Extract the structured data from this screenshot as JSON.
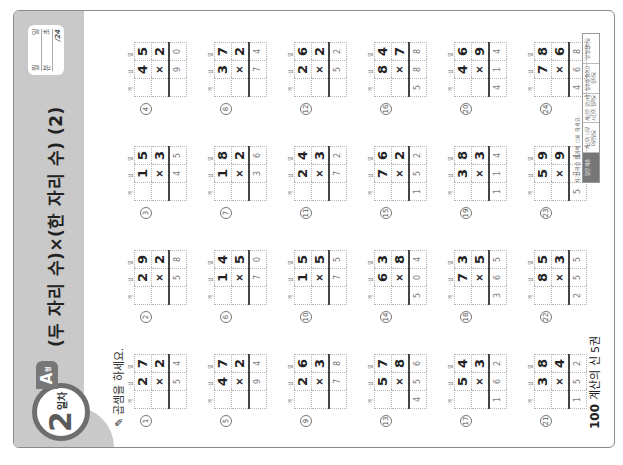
{
  "header": {
    "day_number": "2",
    "day_suffix": "일차",
    "type_label": "A",
    "type_suffix": "형",
    "title": "(두 자리 수)×(한 자리 수) (2)",
    "score_box": {
      "month_label": "월",
      "day_label": "일",
      "minute_label": "분",
      "second_label": "초",
      "total": "/24"
    }
  },
  "instruction": "곱셈을 하세요.",
  "column_headers": [
    "백",
    "십",
    "일"
  ],
  "operator": "×",
  "problems": [
    {
      "n": "1",
      "a": [
        "2",
        "7"
      ],
      "b": "2",
      "ans": [
        "",
        "5",
        "4"
      ]
    },
    {
      "n": "2",
      "a": [
        "2",
        "9"
      ],
      "b": "2",
      "ans": [
        "",
        "5",
        "8"
      ]
    },
    {
      "n": "3",
      "a": [
        "1",
        "5"
      ],
      "b": "3",
      "ans": [
        "",
        "4",
        "5"
      ]
    },
    {
      "n": "4",
      "a": [
        "4",
        "5"
      ],
      "b": "2",
      "ans": [
        "",
        "9",
        "0"
      ]
    },
    {
      "n": "5",
      "a": [
        "4",
        "7"
      ],
      "b": "2",
      "ans": [
        "",
        "9",
        "4"
      ]
    },
    {
      "n": "6",
      "a": [
        "1",
        "4"
      ],
      "b": "5",
      "ans": [
        "",
        "7",
        "0"
      ]
    },
    {
      "n": "7",
      "a": [
        "1",
        "8"
      ],
      "b": "2",
      "ans": [
        "",
        "3",
        "6"
      ]
    },
    {
      "n": "8",
      "a": [
        "3",
        "7"
      ],
      "b": "2",
      "ans": [
        "",
        "7",
        "4"
      ]
    },
    {
      "n": "9",
      "a": [
        "2",
        "6"
      ],
      "b": "3",
      "ans": [
        "",
        "7",
        "8"
      ]
    },
    {
      "n": "10",
      "a": [
        "1",
        "5"
      ],
      "b": "5",
      "ans": [
        "",
        "7",
        "5"
      ]
    },
    {
      "n": "11",
      "a": [
        "2",
        "4"
      ],
      "b": "3",
      "ans": [
        "",
        "7",
        "2"
      ]
    },
    {
      "n": "12",
      "a": [
        "2",
        "6"
      ],
      "b": "2",
      "ans": [
        "",
        "5",
        "2"
      ]
    },
    {
      "n": "13",
      "a": [
        "5",
        "7"
      ],
      "b": "8",
      "ans": [
        "4",
        "5",
        "6"
      ]
    },
    {
      "n": "14",
      "a": [
        "6",
        "3"
      ],
      "b": "8",
      "ans": [
        "5",
        "0",
        "4"
      ]
    },
    {
      "n": "15",
      "a": [
        "7",
        "6"
      ],
      "b": "2",
      "ans": [
        "1",
        "5",
        "2"
      ]
    },
    {
      "n": "16",
      "a": [
        "8",
        "4"
      ],
      "b": "7",
      "ans": [
        "5",
        "8",
        "8"
      ]
    },
    {
      "n": "17",
      "a": [
        "5",
        "4"
      ],
      "b": "3",
      "ans": [
        "1",
        "6",
        "2"
      ]
    },
    {
      "n": "18",
      "a": [
        "7",
        "3"
      ],
      "b": "5",
      "ans": [
        "3",
        "6",
        "5"
      ]
    },
    {
      "n": "19",
      "a": [
        "3",
        "8"
      ],
      "b": "3",
      "ans": [
        "1",
        "1",
        "4"
      ]
    },
    {
      "n": "20",
      "a": [
        "4",
        "6"
      ],
      "b": "9",
      "ans": [
        "4",
        "1",
        "4"
      ]
    },
    {
      "n": "21",
      "a": [
        "3",
        "8"
      ],
      "b": "4",
      "ans": [
        "1",
        "5",
        "2"
      ]
    },
    {
      "n": "22",
      "a": [
        "8",
        "5"
      ],
      "b": "3",
      "ans": [
        "2",
        "5",
        "5"
      ]
    },
    {
      "n": "23",
      "a": [
        "5",
        "9"
      ],
      "b": "9",
      "ans": [
        "5",
        "3",
        "1"
      ]
    },
    {
      "n": "24",
      "a": [
        "7",
        "8"
      ],
      "b": "6",
      "ans": [
        "4",
        "6",
        "8"
      ]
    }
  ],
  "footer": {
    "page_number": "100",
    "book_title": "계산의 신 5권",
    "check_note": "자기 학습 결과에 ○표 하세요.",
    "check_items": [
      "맞은 개수",
      "계산이 너무 어려워요",
      "계산은 맞는데 시간이 걸려요",
      "실수를 줄이고 싶어요",
      "잘 알겠어요"
    ]
  },
  "colors": {
    "header_band": "#c9c9c9",
    "badge_ring": "#6e6e6e",
    "page_border": "#8a8a8a"
  }
}
